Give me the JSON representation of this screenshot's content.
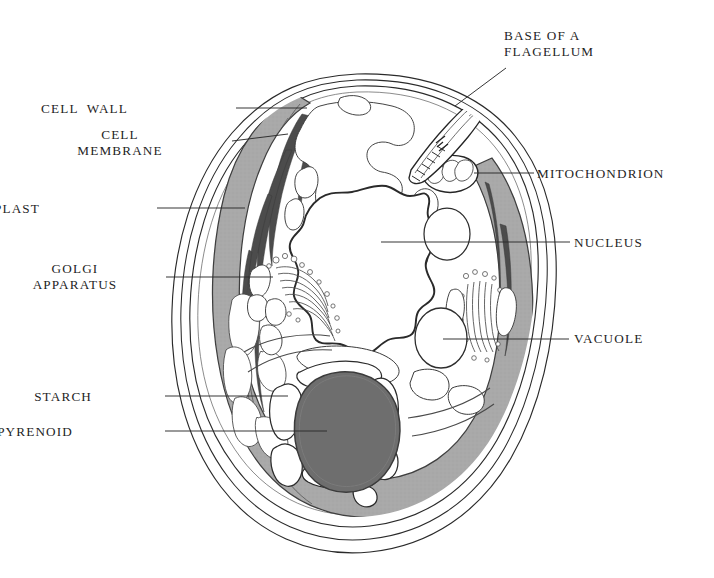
{
  "figure": {
    "background_color": "#ffffff",
    "ink_color": "#1f1f1f",
    "palette": {
      "chloroplast_fill": "#a9a9a9",
      "chloroplast_stroke": "#4a4a4a",
      "pyrenoid_fill": "#6e6e6e",
      "pyrenoid_stroke": "#3b3b3b",
      "starch_fill": "#ffffff",
      "cytoplasm_fill": "#ffffff",
      "wall_stroke": "#2a2a2a",
      "leader_line": "#2b2b2b"
    }
  },
  "labels": [
    {
      "id": "base-of-a-flagellum",
      "name": "BASE OF A FLAGELLUM",
      "lines": [
        "BASE OF A",
        "FLAGELLUM"
      ],
      "align": "left",
      "x": 504,
      "y": 28,
      "leader": {
        "from_x": 506,
        "from_y": 68,
        "to_x": 455,
        "to_y": 106
      }
    },
    {
      "id": "cell-wall",
      "name": "CELL WALL",
      "lines": [
        "CELL  WALL"
      ],
      "align": "right",
      "x": 128,
      "y": 101,
      "leader": {
        "from_x": 236,
        "from_y": 108,
        "to_x": 307,
        "to_y": 108
      }
    },
    {
      "id": "cell-membrane",
      "name": "CELL MEMBRANE",
      "lines": [
        "CELL",
        "MEMBRANE"
      ],
      "align": "center",
      "x": 120,
      "y": 127,
      "leader": {
        "from_x": 232,
        "from_y": 141,
        "to_x": 288,
        "to_y": 134
      }
    },
    {
      "id": "mitochondrion",
      "name": "MITOCHONDRION",
      "lines": [
        "MITOCHONDRION"
      ],
      "align": "left",
      "x": 537,
      "y": 166,
      "leader": {
        "from_x": 534,
        "from_y": 173,
        "to_x": 474,
        "to_y": 173
      }
    },
    {
      "id": "chloroplast",
      "name": "CHLOROPLAST",
      "lines": [
        "CHLOROPLAST"
      ],
      "align": "right",
      "x": 40,
      "y": 201,
      "leader": {
        "from_x": 157,
        "from_y": 208,
        "to_x": 245,
        "to_y": 208
      }
    },
    {
      "id": "nucleus",
      "name": "NUCLEUS",
      "lines": [
        "NUCLEUS"
      ],
      "align": "left",
      "x": 574,
      "y": 235,
      "leader": {
        "from_x": 570,
        "from_y": 242,
        "to_x": 381,
        "to_y": 242
      }
    },
    {
      "id": "golgi-apparatus",
      "name": "GOLGI APPARATUS",
      "lines": [
        "GOLGI",
        "APPARATUS"
      ],
      "align": "center",
      "x": 75,
      "y": 261,
      "leader": {
        "from_x": 166,
        "from_y": 277,
        "to_x": 273,
        "to_y": 277
      }
    },
    {
      "id": "vacuole",
      "name": "VACUOLE",
      "lines": [
        "VACUOLE"
      ],
      "align": "left",
      "x": 574,
      "y": 331,
      "leader": {
        "from_x": 569,
        "from_y": 339,
        "to_x": 443,
        "to_y": 339
      }
    },
    {
      "id": "starch",
      "name": "STARCH",
      "lines": [
        "STARCH"
      ],
      "align": "right",
      "x": 92,
      "y": 389,
      "leader": {
        "from_x": 165,
        "from_y": 396,
        "to_x": 288,
        "to_y": 396
      }
    },
    {
      "id": "pyrenoid",
      "name": "PYRENOID",
      "lines": [
        "PYRENOID"
      ],
      "align": "right",
      "x": 73,
      "y": 424,
      "leader": {
        "from_x": 165,
        "from_y": 431,
        "to_x": 327,
        "to_y": 431
      }
    }
  ],
  "structures": [
    {
      "id": "cell-wall-outer",
      "name": "cell wall outer layer"
    },
    {
      "id": "cell-wall-middle",
      "name": "cell wall middle layer"
    },
    {
      "id": "cell-membrane-layer",
      "name": "cell membrane"
    },
    {
      "id": "chloroplast-body",
      "name": "cup-shaped chloroplast"
    },
    {
      "id": "pyrenoid-body",
      "name": "pyrenoid"
    },
    {
      "id": "starch-plates",
      "name": "starch plates"
    },
    {
      "id": "nucleus-body",
      "name": "nucleus"
    },
    {
      "id": "golgi-left",
      "name": "Golgi apparatus (left)"
    },
    {
      "id": "golgi-right",
      "name": "Golgi apparatus (right)"
    },
    {
      "id": "vacuole-upper",
      "name": "vacuole (upper)"
    },
    {
      "id": "vacuole-lower",
      "name": "vacuole (lower)"
    },
    {
      "id": "mitochondrion-body",
      "name": "mitochondrion"
    },
    {
      "id": "flagellum-base",
      "name": "base of a flagellum"
    },
    {
      "id": "cytoplasm",
      "name": "cytoplasm"
    }
  ]
}
